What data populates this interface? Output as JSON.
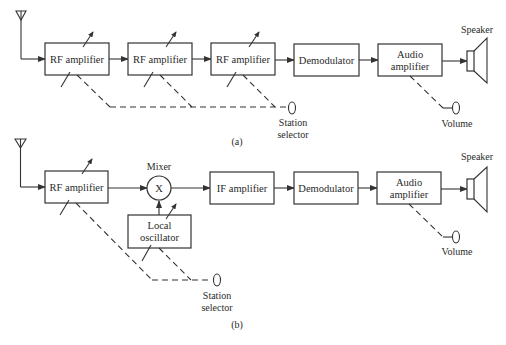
{
  "diagram_a": {
    "caption": "(a)",
    "blocks": [
      {
        "label": "RF amplifier"
      },
      {
        "label": "RF amplifier"
      },
      {
        "label": "RF amplifier"
      },
      {
        "label": "Demodulator"
      },
      {
        "label_line1": "Audio",
        "label_line2": "amplifier"
      }
    ],
    "speaker_label": "Speaker",
    "station_selector_line1": "Station",
    "station_selector_line2": "selector",
    "volume_label": "Volume"
  },
  "diagram_b": {
    "caption": "(b)",
    "blocks": [
      {
        "label": "RF amplifier"
      },
      {
        "label": "IF amplifier"
      },
      {
        "label": "Demodulator"
      },
      {
        "label_line1": "Audio",
        "label_line2": "amplifier"
      }
    ],
    "mixer_label": "Mixer",
    "mixer_symbol": "X",
    "local_oscillator_line1": "Local",
    "local_oscillator_line2": "oscillator",
    "speaker_label": "Speaker",
    "station_selector_line1": "Station",
    "station_selector_line2": "selector",
    "volume_label": "Volume"
  },
  "colors": {
    "stroke": "#333333",
    "text": "#2a2a2a",
    "background": "#ffffff"
  }
}
